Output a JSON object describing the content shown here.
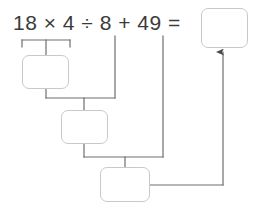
{
  "worksheet": {
    "title": "Order of operations step-by-step working diagram",
    "expression": {
      "full_text": "18 × 4 ÷ 8 + 49 =",
      "operands": [
        "18",
        "4",
        "8",
        "49"
      ],
      "operators": [
        "×",
        "÷",
        "+"
      ],
      "equals_sign": "="
    },
    "boxes": [
      {
        "id": "step-1-box",
        "name": "step-1-answer-box",
        "value": "",
        "placeholder": "",
        "x": 22,
        "y": 55,
        "width": 47,
        "height": 34,
        "describes": "result of 18 × 4"
      },
      {
        "id": "step-2-box",
        "name": "step-2-answer-box",
        "value": "",
        "placeholder": "",
        "x": 61,
        "y": 110,
        "width": 47,
        "height": 34,
        "describes": "result of previous ÷ 8"
      },
      {
        "id": "step-3-box",
        "name": "step-3-answer-box",
        "value": "",
        "placeholder": "",
        "x": 100,
        "y": 167,
        "width": 50,
        "height": 35,
        "describes": "result of previous + 49"
      },
      {
        "id": "final-box",
        "name": "final-answer-box",
        "value": "",
        "placeholder": "",
        "x": 201,
        "y": 8,
        "width": 47,
        "height": 40,
        "describes": "final answer of the full expression"
      }
    ],
    "connectors": {
      "bracket_under_18x4": {
        "name": "bracket-18-times-4",
        "left_x": 22,
        "right_x": 70,
        "y": 40,
        "tick_height": 7,
        "drop_x": 46,
        "drop_to_y": 55
      },
      "drop_from_8": {
        "name": "drop-line-from-8",
        "x": 115,
        "from_y": 36,
        "to_y": 98
      },
      "drop_from_49": {
        "name": "drop-line-from-49",
        "x": 163,
        "from_y": 36,
        "to_y": 157
      },
      "join_step1_to_step2": {
        "name": "join-step1-step2",
        "from_x": 46,
        "from_y": 89,
        "horizontal_y": 98,
        "to_x": 115,
        "drop_x": 84,
        "drop_to_y": 110
      },
      "join_step2_to_step3": {
        "name": "join-step2-step3",
        "from_x": 84,
        "from_y": 144,
        "horizontal_y": 157,
        "to_x": 163,
        "drop_x": 125,
        "drop_to_y": 167
      },
      "arrow_to_final": {
        "name": "arrow-step3-to-final",
        "from_x": 150,
        "from_y": 185,
        "corner_x": 223,
        "arrow_tip_y": 50,
        "arrowhead": "up"
      }
    },
    "colors": {
      "text": "#3b3b3b",
      "box_border": "#c9c9c9",
      "connector_line": "#6e6e6e",
      "light_connector": "#9a9a9a",
      "background": "#ffffff"
    }
  }
}
